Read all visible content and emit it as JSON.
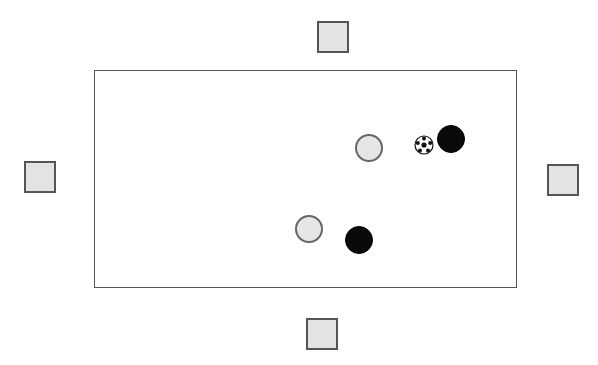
{
  "diagram": {
    "type": "soccer-drill",
    "colors": {
      "field_border": "#555555",
      "square_fill": "#e3e3e3",
      "square_border": "#555555",
      "grey_player_fill": "#e6e6e6",
      "grey_player_border": "#666666",
      "black_player_fill": "#0a0a0a"
    },
    "field": {
      "x": 94,
      "y": 70,
      "width": 423,
      "height": 218
    },
    "squares": [
      {
        "id": "top",
        "x": 317,
        "y": 21,
        "size": 32
      },
      {
        "id": "left",
        "x": 24,
        "y": 161,
        "size": 32
      },
      {
        "id": "right",
        "x": 547,
        "y": 164,
        "size": 32
      },
      {
        "id": "bottom",
        "x": 306,
        "y": 318,
        "size": 32
      }
    ],
    "grey_players": [
      {
        "id": "grey-1",
        "cx": 369,
        "cy": 148,
        "r": 14
      },
      {
        "id": "grey-2",
        "cx": 309,
        "cy": 229,
        "r": 14
      }
    ],
    "black_players": [
      {
        "id": "black-1",
        "cx": 451,
        "cy": 139,
        "r": 14
      },
      {
        "id": "black-2",
        "cx": 359,
        "cy": 240,
        "r": 14
      }
    ],
    "ball": {
      "cx": 424,
      "cy": 145,
      "r": 9
    }
  }
}
